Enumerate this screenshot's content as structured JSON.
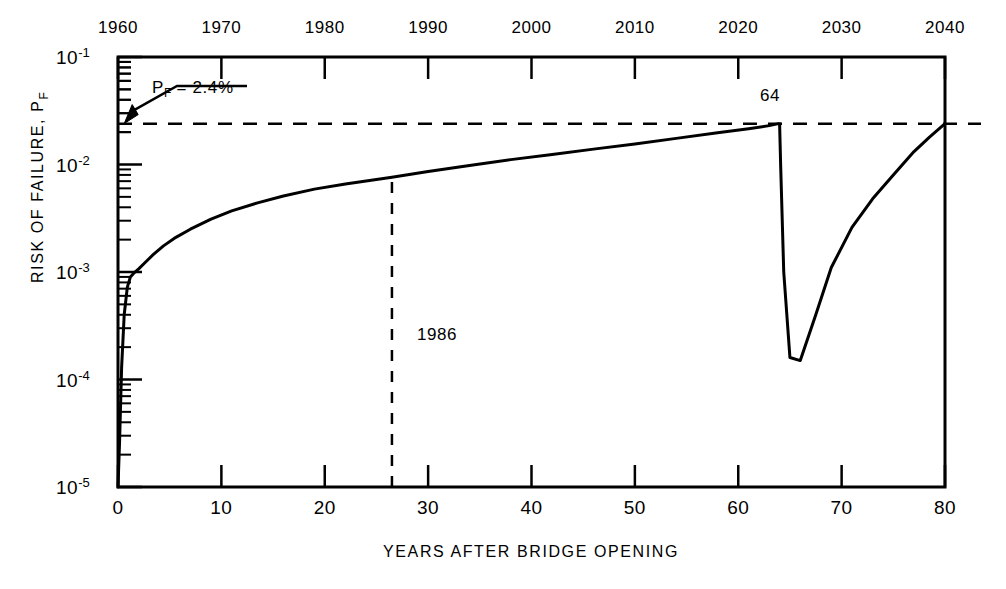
{
  "chart_data": {
    "type": "line",
    "title": "",
    "xlabel": "YEARS AFTER BRIDGE OPENING",
    "ylabel": "RISK OF FAILURE, P_F",
    "ylabel_main": "RISK OF FAILURE, P",
    "ylabel_sub": "F",
    "xlim": [
      0,
      80
    ],
    "ylim": [
      1e-05,
      0.1
    ],
    "yscale": "log",
    "xscale": "linear",
    "grid": false,
    "legend": null,
    "x_ticks": [
      0,
      10,
      20,
      30,
      40,
      50,
      60,
      70,
      80
    ],
    "x_tick_labels": [
      "0",
      "10",
      "20",
      "30",
      "40",
      "50",
      "60",
      "70",
      "80"
    ],
    "x_top_axis_label": "Calendar year",
    "x_top_ticks": [
      0,
      10,
      20,
      30,
      40,
      50,
      60,
      70,
      80
    ],
    "x_top_tick_labels": [
      "1960",
      "1970",
      "1980",
      "1990",
      "2000",
      "2010",
      "2020",
      "2030",
      "2040"
    ],
    "y_ticks": [
      1e-05,
      0.0001,
      0.001,
      0.01,
      0.1
    ],
    "y_tick_labels": [
      {
        "mantissa": "10",
        "exponent": "-5"
      },
      {
        "mantissa": "10",
        "exponent": "-4"
      },
      {
        "mantissa": "10",
        "exponent": "-3"
      },
      {
        "mantissa": "10",
        "exponent": "-2"
      },
      {
        "mantissa": "10",
        "exponent": "-1"
      }
    ],
    "series": [
      {
        "name": "Risk of failure",
        "style": "solid",
        "linewidth": 3,
        "color": "#000000",
        "x": [
          0.0,
          0.15,
          0.35,
          0.6,
          0.9,
          1.2,
          1.5,
          2.0,
          2.6,
          3.4,
          4.4,
          5.6,
          7.0,
          9.0,
          11.0,
          13.5,
          16.0,
          19.0,
          22.0,
          26.5,
          30.0,
          34.0,
          38.0,
          42.0,
          46.0,
          50.0,
          54.0,
          58.0,
          61.0,
          63.0,
          63.9,
          64.0,
          64.1,
          64.4,
          65.0,
          66.0,
          67.5,
          69.0,
          71.0,
          73.0,
          75.0,
          77.0,
          78.5,
          80.0
        ],
        "y": [
          1e-05,
          2.6e-05,
          0.00013,
          0.0004,
          0.00072,
          0.0009,
          0.00097,
          0.00107,
          0.00122,
          0.00145,
          0.00175,
          0.0021,
          0.0025,
          0.0031,
          0.0037,
          0.0044,
          0.0051,
          0.0059,
          0.0066,
          0.0076,
          0.0086,
          0.0098,
          0.0111,
          0.0124,
          0.0139,
          0.0155,
          0.0175,
          0.0197,
          0.0215,
          0.023,
          0.024,
          0.024,
          0.01,
          0.001,
          0.00016,
          0.00015,
          0.0004,
          0.0011,
          0.0026,
          0.0048,
          0.008,
          0.0132,
          0.018,
          0.024
        ]
      }
    ],
    "reference_lines": [
      {
        "name": "pf-threshold",
        "orientation": "horizontal",
        "value": 0.024,
        "style": "dashed",
        "label": "P_F = 2.4%"
      },
      {
        "name": "year-1986",
        "orientation": "vertical",
        "value": 26.5,
        "style": "dashed",
        "label": "1986",
        "y_from": 1e-05,
        "y_to": 0.0076
      }
    ],
    "annotations": [
      {
        "name": "pf-threshold-annotation",
        "text_main": "P",
        "text_sub": "F",
        "text_rest": " = 2.4%",
        "full_text": "P_F = 2.4%",
        "points_to": {
          "x": 0.6,
          "y": 0.024
        },
        "has_arrow": true
      },
      {
        "name": "repair-year-annotation",
        "full_text": "64",
        "at_x": 64,
        "describes": "year of repair / intervention"
      },
      {
        "name": "inspection-year-annotation",
        "full_text": "1986",
        "at_x": 26.5,
        "describes": "calendar year of vertical dashed line"
      }
    ]
  },
  "style": {
    "axis_color": "#000000",
    "curve_color": "#000000",
    "background": "#ffffff"
  }
}
